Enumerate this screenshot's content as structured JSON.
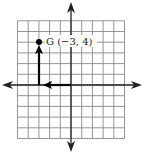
{
  "diagram": {
    "type": "coordinate-grid",
    "x_range": [
      -5,
      5
    ],
    "y_range": [
      -5,
      6
    ],
    "grid_color": "#8a8a8a",
    "axis_color": "#222222",
    "path_color": "#000000",
    "point": {
      "name": "G",
      "x": -3,
      "y": 4,
      "label": "G (−3, 4)"
    },
    "path": [
      {
        "from": [
          0,
          0
        ],
        "to": [
          -3,
          0
        ],
        "direction": "left"
      },
      {
        "from": [
          -3,
          0
        ],
        "to": [
          -3,
          4
        ],
        "direction": "up"
      }
    ]
  }
}
